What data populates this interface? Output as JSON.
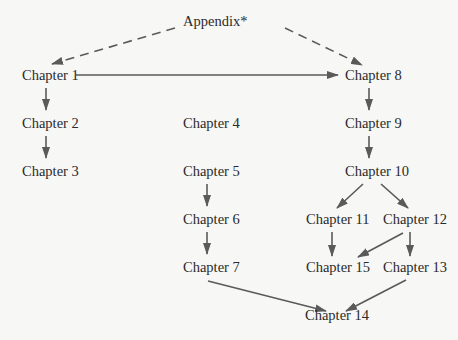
{
  "diagram": {
    "line_color": "#5a5a5a",
    "text_color": "#2a2a2a",
    "background": "#f7f7f6",
    "nodes": [
      {
        "id": "appendix",
        "label": "Appendix*",
        "x": 183,
        "y": 15
      },
      {
        "id": "ch1",
        "label": "Chapter 1",
        "x": 22,
        "y": 69
      },
      {
        "id": "ch8",
        "label": "Chapter 8",
        "x": 345,
        "y": 69
      },
      {
        "id": "ch2",
        "label": "Chapter 2",
        "x": 22,
        "y": 117
      },
      {
        "id": "ch4",
        "label": "Chapter 4",
        "x": 183,
        "y": 117
      },
      {
        "id": "ch9",
        "label": "Chapter 9",
        "x": 345,
        "y": 117
      },
      {
        "id": "ch3",
        "label": "Chapter 3",
        "x": 22,
        "y": 165
      },
      {
        "id": "ch5",
        "label": "Chapter 5",
        "x": 183,
        "y": 165
      },
      {
        "id": "ch10",
        "label": "Chapter 10",
        "x": 345,
        "y": 165
      },
      {
        "id": "ch6",
        "label": "Chapter 6",
        "x": 183,
        "y": 213
      },
      {
        "id": "ch11",
        "label": "Chapter 11",
        "x": 306,
        "y": 213
      },
      {
        "id": "ch12",
        "label": "Chapter 12",
        "x": 383,
        "y": 213
      },
      {
        "id": "ch7",
        "label": "Chapter 7",
        "x": 183,
        "y": 261
      },
      {
        "id": "ch15",
        "label": "Chapter 15",
        "x": 306,
        "y": 261
      },
      {
        "id": "ch13",
        "label": "Chapter 13",
        "x": 383,
        "y": 261
      },
      {
        "id": "ch14",
        "label": "Chapter 14",
        "x": 305,
        "y": 309
      }
    ],
    "edges": [
      {
        "from": "appendix",
        "to": "ch1",
        "style": "dashed",
        "x1": 175,
        "y1": 28,
        "x2": 52,
        "y2": 64
      },
      {
        "from": "appendix",
        "to": "ch8",
        "style": "dashed",
        "x1": 285,
        "y1": 28,
        "x2": 362,
        "y2": 65
      },
      {
        "from": "ch1",
        "to": "ch8",
        "style": "solid",
        "x1": 76,
        "y1": 75,
        "x2": 338,
        "y2": 75
      },
      {
        "from": "ch1",
        "to": "ch2",
        "style": "solid",
        "x1": 46,
        "y1": 88,
        "x2": 46,
        "y2": 110
      },
      {
        "from": "ch2",
        "to": "ch3",
        "style": "solid",
        "x1": 46,
        "y1": 136,
        "x2": 46,
        "y2": 158
      },
      {
        "from": "ch8",
        "to": "ch9",
        "style": "solid",
        "x1": 369,
        "y1": 88,
        "x2": 369,
        "y2": 110
      },
      {
        "from": "ch9",
        "to": "ch10",
        "style": "solid",
        "x1": 369,
        "y1": 136,
        "x2": 369,
        "y2": 158
      },
      {
        "from": "ch5",
        "to": "ch6",
        "style": "solid",
        "x1": 207,
        "y1": 184,
        "x2": 207,
        "y2": 206
      },
      {
        "from": "ch6",
        "to": "ch7",
        "style": "solid",
        "x1": 207,
        "y1": 232,
        "x2": 207,
        "y2": 254
      },
      {
        "from": "ch10",
        "to": "ch11",
        "style": "solid",
        "x1": 363,
        "y1": 184,
        "x2": 337,
        "y2": 208
      },
      {
        "from": "ch10",
        "to": "ch12",
        "style": "solid",
        "x1": 381,
        "y1": 184,
        "x2": 408,
        "y2": 208
      },
      {
        "from": "ch11",
        "to": "ch15",
        "style": "solid",
        "x1": 332,
        "y1": 232,
        "x2": 332,
        "y2": 256
      },
      {
        "from": "ch12",
        "to": "ch15",
        "style": "solid",
        "x1": 403,
        "y1": 233,
        "x2": 358,
        "y2": 257
      },
      {
        "from": "ch12",
        "to": "ch13",
        "style": "solid",
        "x1": 410,
        "y1": 232,
        "x2": 410,
        "y2": 256
      },
      {
        "from": "ch7",
        "to": "ch14",
        "style": "solid",
        "x1": 208,
        "y1": 281,
        "x2": 326,
        "y2": 311
      },
      {
        "from": "ch13",
        "to": "ch14",
        "style": "solid",
        "x1": 406,
        "y1": 280,
        "x2": 346,
        "y2": 311
      }
    ]
  }
}
